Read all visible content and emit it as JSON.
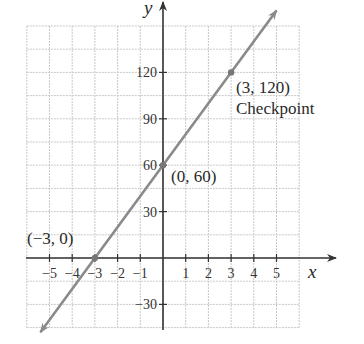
{
  "chart_data": {
    "type": "line",
    "title": "",
    "xlabel": "x",
    "ylabel": "y",
    "xlim": [
      -6,
      6
    ],
    "ylim": [
      -45,
      150
    ],
    "grid": true,
    "grid_step": {
      "x": 1,
      "y": 15
    },
    "x_ticks": [
      -5,
      -4,
      -3,
      -2,
      -1,
      1,
      2,
      3,
      4,
      5
    ],
    "x_tick_labels": [
      "−5",
      "−4",
      "−3",
      "−2",
      "−1",
      "1",
      "2",
      "3",
      "4",
      "5"
    ],
    "y_ticks": [
      -30,
      30,
      60,
      90,
      120
    ],
    "y_tick_labels": [
      "−30",
      "30",
      "60",
      "90",
      "120"
    ],
    "series": [
      {
        "name": "y = 20x + 60",
        "slope": 20,
        "intercept": 60,
        "x": [
          -5.4,
          5.0
        ],
        "y": [
          -48,
          160
        ],
        "color": "#8a8a8a",
        "arrows": "both"
      }
    ],
    "points": [
      {
        "x": -3,
        "y": 0,
        "label": "(−3, 0)"
      },
      {
        "x": 0,
        "y": 60,
        "label": "(0, 60)"
      },
      {
        "x": 3,
        "y": 120,
        "label": "(3, 120)",
        "annotation": "Checkpoint"
      }
    ]
  },
  "labels": {
    "x_axis": "x",
    "y_axis": "y",
    "p1": "(−3, 0)",
    "p2": "(0, 60)",
    "p3": "(3, 120)",
    "p3_note": "Checkpoint"
  },
  "colors": {
    "grid": "#c8c8c8",
    "axis": "#333333",
    "line": "#8a8a8a",
    "point": "#777777"
  }
}
